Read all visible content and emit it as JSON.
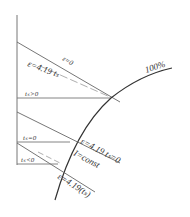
{
  "diagram": {
    "curve_label": "100%",
    "upper_line_top_label": "ε=0",
    "upper_line_bottom_label": "ε=4.19 tₛ",
    "ts_positive_label": "tₛ>0",
    "ts_zero_label": "tₛ=0",
    "ts_negative_label": "tₛ<0",
    "mid_line_label": "ε=4.19 tₛ=0",
    "const_label": "I=const",
    "lower_line_label": "ε=4.19(tₛ)",
    "colors": {
      "line": "#555555",
      "dashed": "#888888",
      "curve": "#333333"
    }
  }
}
